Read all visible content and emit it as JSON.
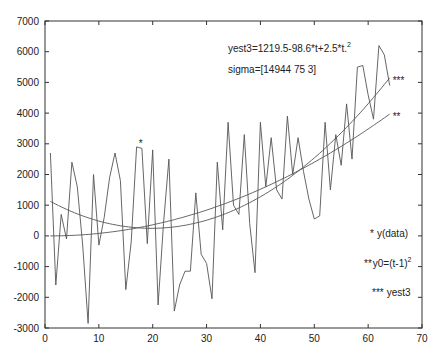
{
  "chart_data": {
    "type": "line",
    "title": "",
    "xlabel": "",
    "ylabel": "",
    "xlim": [
      0,
      70
    ],
    "ylim": [
      -3000,
      7000
    ],
    "grid": false,
    "x_ticks": [
      0,
      10,
      20,
      30,
      40,
      50,
      60,
      70
    ],
    "y_ticks": [
      -3000,
      -2000,
      -1000,
      0,
      1000,
      2000,
      3000,
      4000,
      5000,
      6000,
      7000
    ],
    "annotations": {
      "equation": "yest3=1219.5-98.6*t+2.5*t.",
      "equation_sup": "2",
      "sigma": "sigma=[14944 75 3]"
    },
    "legend": [
      {
        "marker": "*",
        "label": "y(data)"
      },
      {
        "marker": "**",
        "label": "y0=(t-1)",
        "sup": "2"
      },
      {
        "marker": "***",
        "label": "yest3"
      }
    ],
    "series": [
      {
        "name": "y(data)",
        "marker": "*",
        "x": [
          1,
          2,
          3,
          4,
          5,
          6,
          7,
          8,
          9,
          10,
          11,
          12,
          13,
          14,
          15,
          16,
          17,
          18,
          19,
          20,
          21,
          22,
          23,
          24,
          25,
          26,
          27,
          28,
          29,
          30,
          31,
          32,
          33,
          34,
          35,
          36,
          37,
          38,
          39,
          40,
          41,
          42,
          43,
          44,
          45,
          46,
          47,
          48,
          49,
          50,
          51,
          52,
          53,
          54,
          55,
          56,
          57,
          58,
          59,
          60,
          61,
          62,
          63,
          64
        ],
        "values": [
          2700,
          -1600,
          700,
          -100,
          2400,
          1600,
          -300,
          -2850,
          2000,
          -300,
          600,
          1900,
          2700,
          1800,
          -1750,
          -200,
          2900,
          2850,
          -250,
          2800,
          -2250,
          400,
          2500,
          -2450,
          -1600,
          -1150,
          -1150,
          1400,
          -600,
          -900,
          -2050,
          2400,
          200,
          3700,
          1000,
          700,
          3300,
          400,
          -1200,
          3700,
          1600,
          3200,
          1500,
          1200,
          3900,
          2000,
          3200,
          2100,
          1200,
          550,
          650,
          3700,
          1500,
          3300,
          2300,
          4300,
          2500,
          5500,
          5550,
          4600,
          3800,
          6200,
          5900,
          4900
        ]
      },
      {
        "name": "y0=(t-1)^2",
        "marker": "**",
        "formula": "(t-1)^2",
        "x_range": [
          1,
          64
        ]
      },
      {
        "name": "yest3",
        "marker": "***",
        "formula": "1219.5-98.6*t+2.5*t^2",
        "x_range": [
          1,
          64
        ]
      }
    ]
  }
}
